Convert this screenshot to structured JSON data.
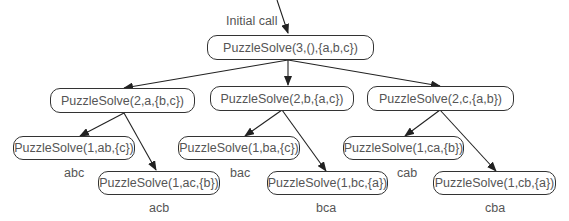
{
  "diagram": {
    "initial_call_label": "Initial call",
    "root": {
      "label": "PuzzleSolve(3,(),{a,b,c})"
    },
    "level2": [
      {
        "label": "PuzzleSolve(2,a,{b,c})"
      },
      {
        "label": "PuzzleSolve(2,b,{a,c})"
      },
      {
        "label": "PuzzleSolve(2,c,{a,b})"
      }
    ],
    "level3": [
      {
        "label": "PuzzleSolve(1,ab,{c})",
        "result": "abc"
      },
      {
        "label": "PuzzleSolve(1,ac,{b})",
        "result": "acb"
      },
      {
        "label": "PuzzleSolve(1,ba,{c})",
        "result": "bac"
      },
      {
        "label": "PuzzleSolve(1,bc,{a})",
        "result": "bca"
      },
      {
        "label": "PuzzleSolve(1,ca,{b})",
        "result": "cab"
      },
      {
        "label": "PuzzleSolve(1,cb,{a})",
        "result": "cba"
      }
    ]
  }
}
